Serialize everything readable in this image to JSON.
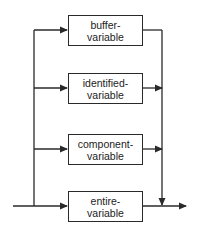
{
  "diagram": {
    "type": "syntax-diagram",
    "colors": {
      "line": "#2a2a2a",
      "text": "#222222",
      "background": "#ffffff"
    },
    "boxes": [
      {
        "id": "buffer-variable",
        "line1": "buffer-",
        "line2": "variable"
      },
      {
        "id": "identified-variable",
        "line1": "identified-",
        "line2": "variable"
      },
      {
        "id": "component-variable",
        "line1": "component-",
        "line2": "variable"
      },
      {
        "id": "entire-variable",
        "line1": "entire-",
        "line2": "variable"
      }
    ]
  }
}
